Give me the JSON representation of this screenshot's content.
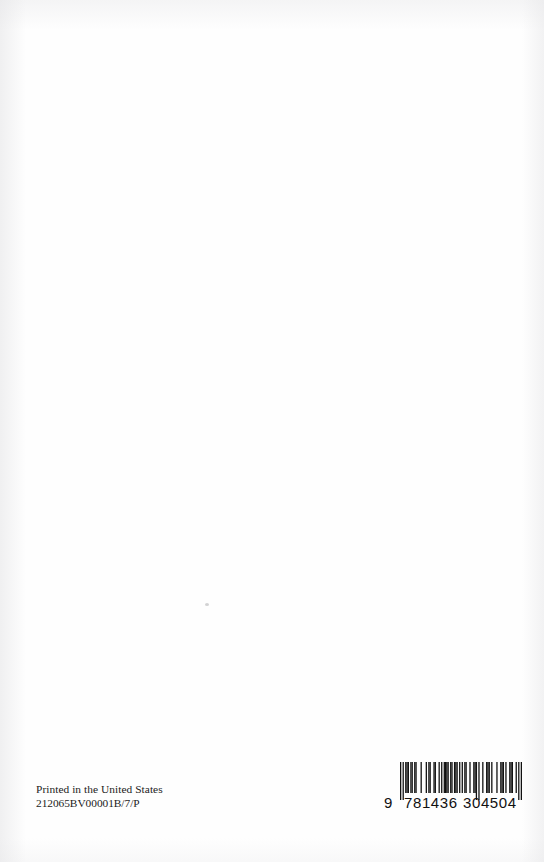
{
  "page": {
    "kind": "scanned-book-back-cover",
    "background_color": "#fefefe",
    "ink_color": "#1c1c1c",
    "width": 544,
    "height": 862
  },
  "imprint": {
    "line1": "Printed in the United States",
    "line2": "212065BV00001B/7/P"
  },
  "barcode": {
    "symbology": "EAN-13",
    "value": "9781436304504",
    "lead_digit": "9",
    "left_group": "781436",
    "right_group": "304504",
    "bar_color": "#111111",
    "modules": [
      1,
      0,
      1,
      0,
      1,
      1,
      1,
      0,
      1,
      1,
      0,
      1,
      1,
      0,
      0,
      0,
      1,
      0,
      0,
      0,
      1,
      0,
      1,
      1,
      0,
      0,
      1,
      1,
      0,
      0,
      1,
      0,
      1,
      0,
      1,
      1,
      1,
      1,
      0,
      1,
      1,
      0,
      1,
      1,
      1,
      0,
      1,
      0,
      1,
      0,
      1,
      1,
      0,
      0,
      1,
      0,
      0,
      1,
      1,
      1,
      0,
      1,
      0,
      0,
      1,
      0,
      0,
      1,
      1,
      1,
      0,
      1,
      0,
      0,
      0,
      1,
      0,
      0,
      1,
      1,
      1,
      0,
      1,
      0,
      0,
      1,
      1,
      1,
      0,
      0,
      1,
      0,
      1,
      0,
      1
    ],
    "guard_indices": [
      0,
      1,
      2,
      59,
      60,
      61,
      62,
      63,
      92,
      93,
      94
    ]
  },
  "artifacts": {
    "speck_label": "scan-speck"
  }
}
